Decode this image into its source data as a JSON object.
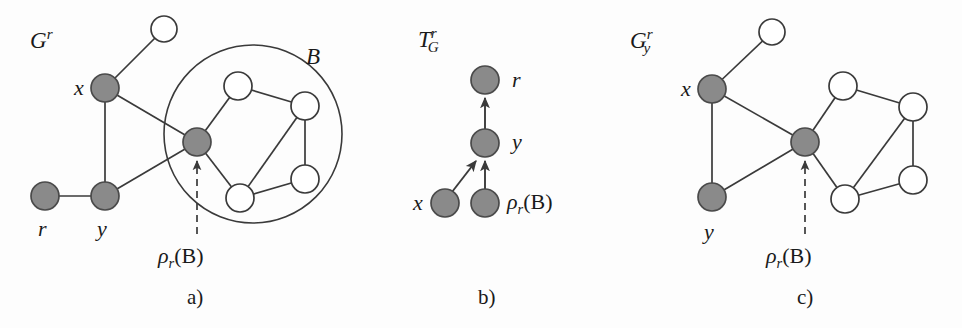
{
  "figure": {
    "background_color": "#fdfdfd",
    "node_fill_gray": "#8a8a8a",
    "node_fill_white": "#ffffff",
    "stroke_color": "#3a3a3a",
    "text_color": "#1a1a1a"
  },
  "panels": [
    {
      "id": "a",
      "caption": "a)",
      "graph_label_base": "G",
      "graph_label_sup": "r",
      "graph_label_sub": "",
      "set_label": "B",
      "pivot_label_rho": "ρ",
      "pivot_label_sub": "r",
      "pivot_label_arg": "(B)",
      "node_labels": [
        "x",
        "r",
        "y"
      ],
      "nodes": [
        {
          "name": "top-white-node",
          "cx": 164,
          "cy": 29,
          "r": 13,
          "fill": "white",
          "label": ""
        },
        {
          "name": "node-x",
          "cx": 105,
          "cy": 88,
          "r": 14,
          "fill": "gray",
          "label": "x"
        },
        {
          "name": "node-r",
          "cx": 45,
          "cy": 196,
          "r": 14,
          "fill": "gray",
          "label": "r"
        },
        {
          "name": "node-y",
          "cx": 105,
          "cy": 196,
          "r": 14,
          "fill": "gray",
          "label": "y"
        },
        {
          "name": "node-pivot",
          "cx": 197,
          "cy": 142,
          "r": 14,
          "fill": "gray",
          "label": ""
        },
        {
          "name": "block-node-top",
          "cx": 238,
          "cy": 86,
          "r": 14,
          "fill": "white",
          "label": ""
        },
        {
          "name": "block-node-right-top",
          "cx": 305,
          "cy": 106,
          "r": 14,
          "fill": "white",
          "label": ""
        },
        {
          "name": "block-node-right-bottom",
          "cx": 305,
          "cy": 179,
          "r": 14,
          "fill": "white",
          "label": ""
        },
        {
          "name": "block-node-bottom",
          "cx": 240,
          "cy": 198,
          "r": 14,
          "fill": "white",
          "label": ""
        }
      ],
      "edges": [
        [
          164,
          29,
          105,
          88
        ],
        [
          105,
          88,
          105,
          196
        ],
        [
          105,
          88,
          197,
          142
        ],
        [
          45,
          196,
          105,
          196
        ],
        [
          105,
          196,
          197,
          142
        ],
        [
          197,
          142,
          238,
          86
        ],
        [
          238,
          86,
          305,
          106
        ],
        [
          305,
          106,
          305,
          179
        ],
        [
          305,
          106,
          240,
          198
        ],
        [
          240,
          198,
          305,
          179
        ],
        [
          197,
          142,
          240,
          198
        ]
      ],
      "block_circle": {
        "cx": 253,
        "cy": 134,
        "r": 89
      },
      "arrow": {
        "x1": 197,
        "y1": 232,
        "x2": 197,
        "y2": 160,
        "style": "dashed"
      }
    },
    {
      "id": "b",
      "caption": "b)",
      "graph_label_base": "T",
      "graph_label_sup": "r",
      "graph_label_sub": "G",
      "node_labels": [
        "r",
        "y",
        "x"
      ],
      "pivot_label_rho": "ρ",
      "pivot_label_sub": "r",
      "pivot_label_arg": "(B)",
      "nodes": [
        {
          "name": "node-r",
          "cx": 485,
          "cy": 80,
          "r": 14,
          "fill": "gray",
          "label": "r"
        },
        {
          "name": "node-y",
          "cx": 485,
          "cy": 143,
          "r": 14,
          "fill": "gray",
          "label": "y"
        },
        {
          "name": "node-x",
          "cx": 445,
          "cy": 203,
          "r": 14,
          "fill": "gray",
          "label": "x"
        },
        {
          "name": "node-pivot",
          "cx": 485,
          "cy": 203,
          "r": 14,
          "fill": "gray",
          "label": ""
        }
      ],
      "arrows": [
        {
          "x1": 485,
          "y1": 129,
          "x2": 485,
          "y2": 97
        },
        {
          "x1": 485,
          "y1": 189,
          "x2": 485,
          "y2": 160
        },
        {
          "x1": 452,
          "y1": 191,
          "x2": 476,
          "y2": 160
        }
      ]
    },
    {
      "id": "c",
      "caption": "c)",
      "graph_label_base": "G",
      "graph_label_sup": "r",
      "graph_label_sub": "y",
      "node_labels": [
        "x",
        "y"
      ],
      "pivot_label_rho": "ρ",
      "pivot_label_sub": "r",
      "pivot_label_arg": "(B)",
      "nodes": [
        {
          "name": "top-white-node",
          "cx": 772,
          "cy": 32,
          "r": 13,
          "fill": "white",
          "label": ""
        },
        {
          "name": "node-x",
          "cx": 712,
          "cy": 89,
          "r": 14,
          "fill": "gray",
          "label": "x"
        },
        {
          "name": "node-y",
          "cx": 712,
          "cy": 197,
          "r": 14,
          "fill": "gray",
          "label": "y"
        },
        {
          "name": "node-pivot",
          "cx": 805,
          "cy": 142,
          "r": 14,
          "fill": "gray",
          "label": ""
        },
        {
          "name": "block-node-top",
          "cx": 843,
          "cy": 86,
          "r": 14,
          "fill": "white",
          "label": ""
        },
        {
          "name": "block-node-right-top",
          "cx": 913,
          "cy": 107,
          "r": 14,
          "fill": "white",
          "label": ""
        },
        {
          "name": "block-node-right-bottom",
          "cx": 913,
          "cy": 180,
          "r": 14,
          "fill": "white",
          "label": ""
        },
        {
          "name": "block-node-bottom",
          "cx": 845,
          "cy": 199,
          "r": 14,
          "fill": "white",
          "label": ""
        }
      ],
      "edges": [
        [
          772,
          32,
          712,
          89
        ],
        [
          712,
          89,
          712,
          197
        ],
        [
          712,
          89,
          805,
          142
        ],
        [
          712,
          197,
          805,
          142
        ],
        [
          805,
          142,
          843,
          86
        ],
        [
          843,
          86,
          913,
          107
        ],
        [
          913,
          107,
          913,
          180
        ],
        [
          913,
          107,
          845,
          199
        ],
        [
          845,
          199,
          913,
          180
        ],
        [
          805,
          142,
          845,
          199
        ]
      ],
      "arrow": {
        "x1": 805,
        "y1": 232,
        "x2": 805,
        "y2": 160,
        "style": "dashed"
      }
    }
  ],
  "labels": {
    "panel_a_graph": "G",
    "panel_a_graph_sup": "r",
    "panel_a_set": "B",
    "panel_a_x": "x",
    "panel_a_r": "r",
    "panel_a_y": "y",
    "panel_a_rho": "ρ",
    "panel_a_rho_sub": "r",
    "panel_a_rho_arg": "(B)",
    "panel_a_caption": "a)",
    "panel_b_graph": "T",
    "panel_b_graph_sup": "r",
    "panel_b_graph_sub": "G",
    "panel_b_r": "r",
    "panel_b_y": "y",
    "panel_b_x": "x",
    "panel_b_rho": "ρ",
    "panel_b_rho_sub": "r",
    "panel_b_rho_arg": "(B)",
    "panel_b_caption": "b)",
    "panel_c_graph": "G",
    "panel_c_graph_sup": "r",
    "panel_c_graph_sub": "y",
    "panel_c_x": "x",
    "panel_c_y": "y",
    "panel_c_rho": "ρ",
    "panel_c_rho_sub": "r",
    "panel_c_rho_arg": "(B)",
    "panel_c_caption": "c)"
  }
}
